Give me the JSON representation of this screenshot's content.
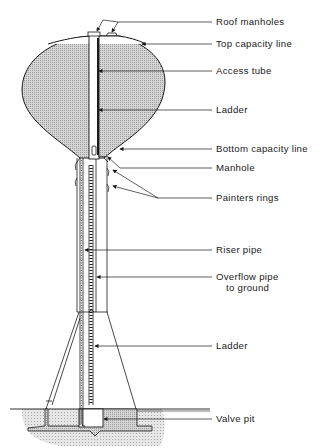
{
  "diagram": {
    "colors": {
      "ink": "#1a1a1a",
      "tank_fill": "#c9c9c9",
      "ground_fill": "#d8d8d8",
      "background": "#ffffff"
    },
    "labels": [
      {
        "id": "roof-manholes",
        "text": "Roof manholes",
        "x": 216,
        "y": 17
      },
      {
        "id": "top-capacity-line",
        "text": "Top capacity line",
        "x": 216,
        "y": 39
      },
      {
        "id": "access-tube",
        "text": "Access tube",
        "x": 216,
        "y": 66
      },
      {
        "id": "ladder-upper",
        "text": "Ladder",
        "x": 216,
        "y": 105
      },
      {
        "id": "bottom-capacity-line",
        "text": "Bottom capacity line",
        "x": 216,
        "y": 144
      },
      {
        "id": "manhole",
        "text": "Manhole",
        "x": 216,
        "y": 163
      },
      {
        "id": "painters-rings",
        "text": "Painters rings",
        "x": 216,
        "y": 193
      },
      {
        "id": "riser-pipe",
        "text": "Riser pipe",
        "x": 216,
        "y": 245
      },
      {
        "id": "overflow-pipe",
        "text": "Overflow pipe",
        "line2": "to ground",
        "x": 216,
        "y": 272
      },
      {
        "id": "ladder-lower",
        "text": "Ladder",
        "x": 216,
        "y": 341
      },
      {
        "id": "valve-pit",
        "text": "Valve pit",
        "x": 216,
        "y": 414
      }
    ]
  }
}
